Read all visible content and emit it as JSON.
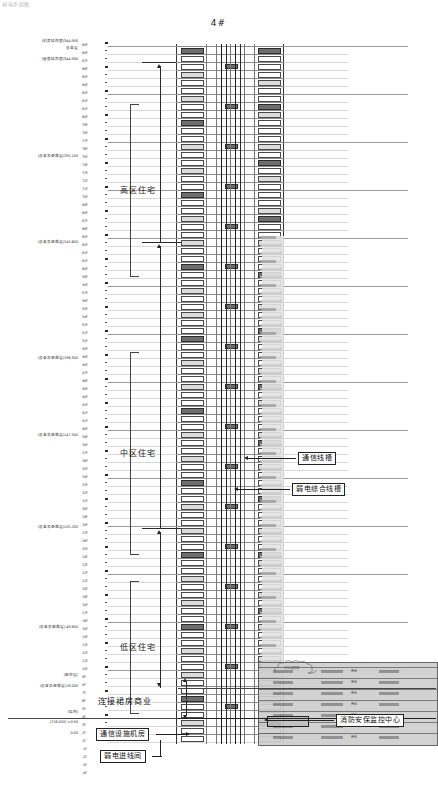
{
  "drawing": {
    "title": "4#",
    "top_fragment": "弱电系统图",
    "type": "riser-diagram"
  },
  "zones": [
    {
      "id": "high",
      "label": "高区住宅",
      "top": 140,
      "height": 100
    },
    {
      "id": "mid",
      "label": "中区住宅",
      "top": 388,
      "height": 130
    },
    {
      "id": "low",
      "label": "低区住宅",
      "top": 617,
      "height": 60
    }
  ],
  "callouts": [
    {
      "id": "comm-trough",
      "label": "通信线槽",
      "x": 298,
      "y": 452
    },
    {
      "id": "elv-trough",
      "label": "弱电综合线槽",
      "x": 292,
      "y": 483
    },
    {
      "id": "podium-link",
      "label": "连接裙房商业",
      "x": 98,
      "y": 697
    },
    {
      "id": "comm-room",
      "label": "通信设施机房",
      "x": 96,
      "y": 730
    },
    {
      "id": "elv-entry",
      "label": "弱电进线间",
      "x": 100,
      "y": 752
    },
    {
      "id": "fire-center",
      "label": "消防安保监控中心",
      "x": 336,
      "y": 714
    }
  ],
  "elevation_notes": [
    {
      "text": "(机房结构面)344.900",
      "y": 41
    },
    {
      "text": "设备层",
      "y": 48
    },
    {
      "text": "(屋面结构面)344.900",
      "y": 59
    },
    {
      "text": "(设备及避难层)295.100",
      "y": 156
    },
    {
      "text": "(设备及避难层)245.600",
      "y": 242
    },
    {
      "text": "(设备及避难层)196.300",
      "y": 358
    },
    {
      "text": "(设备及避难层)147.500",
      "y": 435
    },
    {
      "text": "(设备及避难层)105.200",
      "y": 527
    },
    {
      "text": "(设备及避难层) 49.800",
      "y": 627
    },
    {
      "text": "(架空层)",
      "y": 675
    },
    {
      "text": "(设备及避难层)18.000",
      "y": 686
    },
    {
      "text": "(结构)",
      "y": 712
    },
    {
      "text": "(216.000) ±0.00",
      "y": 722
    },
    {
      "text": "-0.00",
      "y": 733
    }
  ],
  "floor_labels": [
    {
      "t": "68F",
      "y": 46
    },
    {
      "t": "68F",
      "y": 54
    },
    {
      "t": "67F",
      "y": 62
    },
    {
      "t": "66F",
      "y": 70
    },
    {
      "t": "65F",
      "y": 78
    },
    {
      "t": "64F",
      "y": 86
    },
    {
      "t": "63F",
      "y": 94
    },
    {
      "t": "62F",
      "y": 102
    },
    {
      "t": "61F",
      "y": 110
    },
    {
      "t": "60F",
      "y": 118
    },
    {
      "t": "79F",
      "y": 126
    },
    {
      "t": "78F",
      "y": 134
    },
    {
      "t": "77F",
      "y": 142
    },
    {
      "t": "76F",
      "y": 150
    },
    {
      "t": "75F",
      "y": 158
    },
    {
      "t": "74F",
      "y": 166
    },
    {
      "t": "73F",
      "y": 174
    },
    {
      "t": "72F",
      "y": 182
    },
    {
      "t": "71F",
      "y": 190
    },
    {
      "t": "70F",
      "y": 198
    },
    {
      "t": "69F",
      "y": 206
    },
    {
      "t": "68F",
      "y": 214
    },
    {
      "t": "67F",
      "y": 222
    },
    {
      "t": "66F",
      "y": 230
    },
    {
      "t": "65F",
      "y": 238
    },
    {
      "t": "63F",
      "y": 246
    },
    {
      "t": "62F",
      "y": 254
    },
    {
      "t": "61F",
      "y": 262
    },
    {
      "t": "60F",
      "y": 270
    },
    {
      "t": "59F",
      "y": 278
    },
    {
      "t": "58F",
      "y": 286
    },
    {
      "t": "57F",
      "y": 294
    },
    {
      "t": "56F",
      "y": 302
    },
    {
      "t": "55F",
      "y": 310
    },
    {
      "t": "54F",
      "y": 318
    },
    {
      "t": "53F",
      "y": 326
    },
    {
      "t": "52F",
      "y": 334
    },
    {
      "t": "51F",
      "y": 342
    },
    {
      "t": "50F",
      "y": 350
    },
    {
      "t": "49F",
      "y": 358
    },
    {
      "t": "48F",
      "y": 366
    },
    {
      "t": "47F",
      "y": 374
    },
    {
      "t": "46F",
      "y": 382
    },
    {
      "t": "45F",
      "y": 390
    },
    {
      "t": "44F",
      "y": 398
    },
    {
      "t": "43F",
      "y": 406
    },
    {
      "t": "42F",
      "y": 414
    },
    {
      "t": "41F",
      "y": 422
    },
    {
      "t": "40F",
      "y": 430
    },
    {
      "t": "39F",
      "y": 438
    },
    {
      "t": "38F",
      "y": 446
    },
    {
      "t": "37F",
      "y": 454
    },
    {
      "t": "36F",
      "y": 462
    },
    {
      "t": "35F",
      "y": 470
    },
    {
      "t": "34F",
      "y": 478
    },
    {
      "t": "33F",
      "y": 486
    },
    {
      "t": "32F",
      "y": 494
    },
    {
      "t": "31F",
      "y": 502
    },
    {
      "t": "30F",
      "y": 510
    },
    {
      "t": "29F",
      "y": 518
    },
    {
      "t": "28F",
      "y": 526
    },
    {
      "t": "27F",
      "y": 534
    },
    {
      "t": "26F",
      "y": 542
    },
    {
      "t": "25F",
      "y": 550
    },
    {
      "t": "24F",
      "y": 558
    },
    {
      "t": "23F",
      "y": 566
    },
    {
      "t": "22F",
      "y": 574
    },
    {
      "t": "21F",
      "y": 582
    },
    {
      "t": "20F",
      "y": 590
    },
    {
      "t": "19F",
      "y": 598
    },
    {
      "t": "18F",
      "y": 606
    },
    {
      "t": "17F",
      "y": 614
    },
    {
      "t": "16F",
      "y": 622
    },
    {
      "t": "15F",
      "y": 630
    },
    {
      "t": "14F",
      "y": 638
    },
    {
      "t": "13F",
      "y": 646
    },
    {
      "t": "12F",
      "y": 654
    },
    {
      "t": "11F",
      "y": 662
    },
    {
      "t": "10F",
      "y": 670
    },
    {
      "t": "9F",
      "y": 678
    },
    {
      "t": "8F",
      "y": 686
    },
    {
      "t": "7F",
      "y": 694
    },
    {
      "t": "6F",
      "y": 702
    },
    {
      "t": "5F",
      "y": 710
    },
    {
      "t": "4F",
      "y": 718
    },
    {
      "t": "3F",
      "y": 726
    },
    {
      "t": "2F",
      "y": 734
    },
    {
      "t": "1F",
      "y": 742
    },
    {
      "t": "-1F",
      "y": 750
    },
    {
      "t": "-2F",
      "y": 758
    },
    {
      "t": "-3F",
      "y": 766
    },
    {
      "t": "-4F",
      "y": 774
    }
  ],
  "podium": {
    "rows": [
      "商业",
      "商业",
      "商业",
      "商业",
      "商业",
      "商业",
      "商业"
    ],
    "cloud_note": "详见裙房图"
  },
  "colors": {
    "line": "#2b2b2b",
    "grid": "#8d8d8d",
    "shade": "#c9c9c9",
    "shade_dark": "#9e9e9e",
    "paper": "#ffffff"
  }
}
